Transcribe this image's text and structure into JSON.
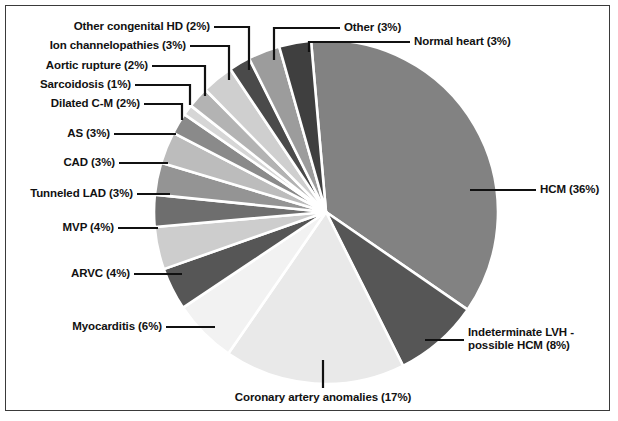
{
  "chart_data": {
    "type": "pie",
    "title": "",
    "xlabel": "",
    "ylabel": "",
    "legend_position": "none",
    "grid": false,
    "units": "percent",
    "start_angle_deg": -95,
    "direction": "clockwise",
    "categories": [
      "HCM",
      "Indeterminate LVH - possible HCM",
      "Coronary artery anomalies",
      "Myocarditis",
      "ARVC",
      "MVP",
      "Tunneled LAD",
      "CAD",
      "AS",
      "Dilated C-M",
      "Sarcoidosis",
      "Aortic rupture",
      "Ion channelopathies",
      "Other congenital HD",
      "Other",
      "Normal heart"
    ],
    "values": [
      36,
      8,
      17,
      6,
      4,
      4,
      3,
      3,
      3,
      2,
      1,
      2,
      3,
      2,
      3,
      3
    ],
    "colors": [
      "#828282",
      "#565656",
      "#e9e9e9",
      "#f2f2f2",
      "#565656",
      "#cdcdcd",
      "#6e6e6e",
      "#949494",
      "#bcbcbc",
      "#8a8a8a",
      "#d6d6d6",
      "#b3b3b3",
      "#cfcfcf",
      "#4a4a4a",
      "#9c9c9c",
      "#3f3f3f"
    ],
    "slices": [
      {
        "label": "HCM (36%)",
        "name": "HCM",
        "value": 36
      },
      {
        "label": "Indeterminate LVH -",
        "label2": "possible HCM (8%)",
        "name": "Indeterminate LVH - possible HCM",
        "value": 8
      },
      {
        "label": "Coronary artery anomalies (17%)",
        "name": "Coronary artery anomalies",
        "value": 17
      },
      {
        "label": "Myocarditis (6%)",
        "name": "Myocarditis",
        "value": 6
      },
      {
        "label": "ARVC (4%)",
        "name": "ARVC",
        "value": 4
      },
      {
        "label": "MVP (4%)",
        "name": "MVP",
        "value": 4
      },
      {
        "label": "Tunneled LAD (3%)",
        "name": "Tunneled LAD",
        "value": 3
      },
      {
        "label": "CAD (3%)",
        "name": "CAD",
        "value": 3
      },
      {
        "label": "AS (3%)",
        "name": "AS",
        "value": 3
      },
      {
        "label": "Dilated C-M (2%)",
        "name": "Dilated C-M",
        "value": 2
      },
      {
        "label": "Sarcoidosis (1%)",
        "name": "Sarcoidosis",
        "value": 1
      },
      {
        "label": "Aortic rupture (2%)",
        "name": "Aortic rupture",
        "value": 2
      },
      {
        "label": "Ion channelopathies (3%)",
        "name": "Ion channelopathies",
        "value": 3
      },
      {
        "label": "Other congenital HD (2%)",
        "name": "Other congenital HD",
        "value": 2
      },
      {
        "label": "Other (3%)",
        "name": "Other",
        "value": 3
      },
      {
        "label": "Normal heart (3%)",
        "name": "Normal heart",
        "value": 3
      }
    ]
  },
  "labels": {
    "hcm": "HCM (36%)",
    "indeterminate_lvh_line1": "Indeterminate LVH -",
    "indeterminate_lvh_line2": "possible HCM (8%)",
    "coronary_artery_anomalies": "Coronary artery anomalies (17%)",
    "myocarditis": "Myocarditis (6%)",
    "arvc": "ARVC (4%)",
    "mvp": "MVP (4%)",
    "tunneled_lad": "Tunneled LAD (3%)",
    "cad": "CAD (3%)",
    "as": "AS (3%)",
    "dilated_cm": "Dilated C-M (2%)",
    "sarcoidosis": "Sarcoidosis (1%)",
    "aortic_rupture": "Aortic rupture (2%)",
    "ion_channelopathies": "Ion channelopathies (3%)",
    "other_congenital_hd": "Other congenital HD (2%)",
    "other": "Other (3%)",
    "normal_heart": "Normal heart (3%)"
  },
  "style": {
    "background": "#ffffff",
    "border_color": "#3a3a3a",
    "leader_color": "#111111",
    "slice_gap_color": "#ffffff",
    "text_color": "#111111"
  },
  "geometry": {
    "center_x": 326,
    "center_y": 212,
    "radius": 172
  }
}
